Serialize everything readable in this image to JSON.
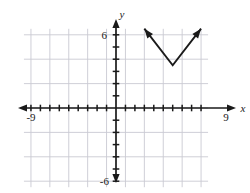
{
  "figure": {
    "kind": "coordinate-plane-graph",
    "width": 250,
    "height": 193,
    "background_color": "#ffffff",
    "grid_color": "#c9c9d2",
    "axis_color": "#1a1a1a",
    "curve_color": "#1a1a1a"
  },
  "axes": {
    "x_axis_label": "x",
    "y_axis_label": "y",
    "x_min": -9,
    "x_max": 9,
    "y_min": -6.5,
    "y_max": 7,
    "x_tick_labels": [
      "-9",
      "9"
    ],
    "y_tick_labels": [
      "6",
      "-6"
    ],
    "x_label_left": "-9",
    "x_label_right": "9",
    "y_label_top": "6",
    "y_label_bottom": "-6",
    "tick_interval": 1,
    "grid_on": true,
    "grid_interval": 2
  },
  "chart_data": {
    "type": "line",
    "title": "",
    "xlabel": "x",
    "ylabel": "y",
    "xlim": [
      -9,
      9
    ],
    "ylim": [
      -6.5,
      7
    ],
    "grid": true,
    "legend": "none",
    "series": [
      {
        "name": "absolute-value-v-graph",
        "shape": "V",
        "vertex": [
          6,
          3.5
        ],
        "points": [
          [
            3,
            6.5
          ],
          [
            6,
            3.5
          ],
          [
            9,
            6.5
          ]
        ],
        "arrows": [
          "start",
          "end"
        ],
        "slope_left": -1,
        "slope_right": 1
      }
    ],
    "annotations": []
  },
  "pixel_geometry": {
    "origin_x": 116,
    "origin_y": 108,
    "unit_x": 9.45,
    "unit_y": 12.2
  }
}
